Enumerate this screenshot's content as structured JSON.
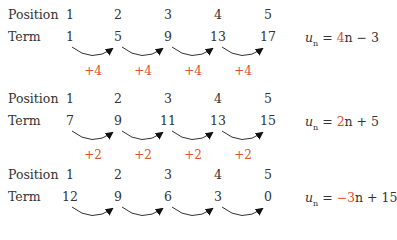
{
  "columns_x": [
    68,
    118,
    168,
    218,
    268
  ],
  "labels": {
    "position": "Position",
    "term": "Term"
  },
  "accent_color": "#d9542a",
  "sequences": [
    {
      "positions": [
        "1",
        "2",
        "3",
        "4",
        "5"
      ],
      "terms": [
        "1",
        "5",
        "9",
        "13",
        "17"
      ],
      "differences": [
        "+4",
        "+4",
        "+4",
        "+4"
      ],
      "formula": {
        "var": "u",
        "sub": "n",
        "eq": " = ",
        "coef": "4",
        "rest": "n − 3"
      }
    },
    {
      "positions": [
        "1",
        "2",
        "3",
        "4",
        "5"
      ],
      "terms": [
        "7",
        "9",
        "11",
        "13",
        "15"
      ],
      "differences": [
        "+2",
        "+2",
        "+2",
        "+2"
      ],
      "formula": {
        "var": "u",
        "sub": "n",
        "eq": " = ",
        "coef": "2",
        "rest": "n + 5"
      }
    },
    {
      "positions": [
        "1",
        "2",
        "3",
        "4",
        "5"
      ],
      "terms": [
        "12",
        "9",
        "6",
        "3",
        "0"
      ],
      "differences": [],
      "formula": {
        "var": "u",
        "sub": "n",
        "eq": " = ",
        "coef": "−3",
        "rest": "n + 15"
      }
    }
  ]
}
